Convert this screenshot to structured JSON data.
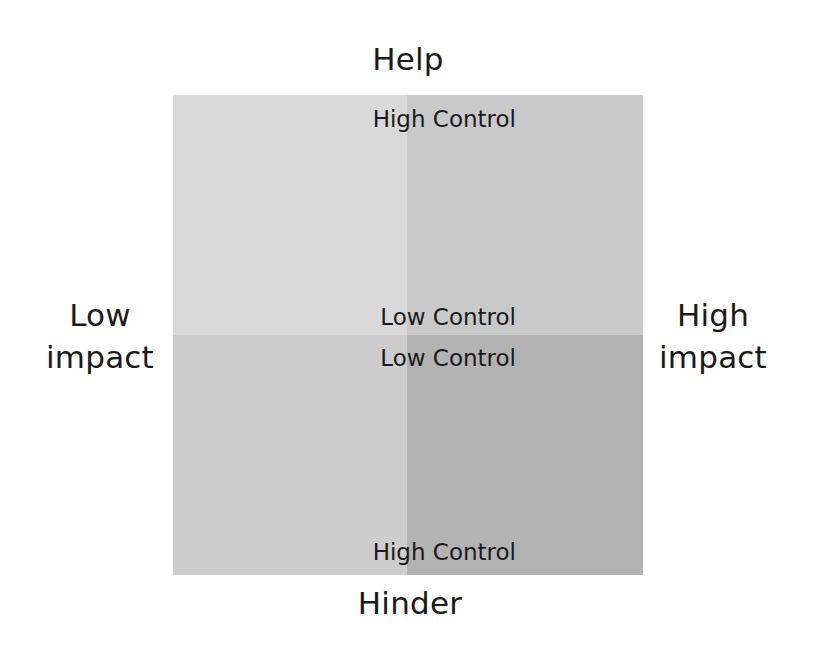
{
  "diagram": {
    "type": "2x2 quadrant matrix",
    "axes": {
      "top": "Help",
      "bottom": "Hinder",
      "left": {
        "line1": "Low",
        "line2": "impact"
      },
      "right": {
        "line1": "High",
        "line2": "impact"
      }
    },
    "control_labels": {
      "top": "High Control",
      "center_upper": "Low Control",
      "center_lower": "Low Control",
      "bottom": "High Control"
    },
    "quadrants": {
      "top_left": {
        "position": "Help / Low impact",
        "color": "#d9d9d9"
      },
      "top_right": {
        "position": "Help / High impact",
        "color": "#c9c9c9"
      },
      "bottom_left": {
        "position": "Hinder / Low impact",
        "color": "#cdcdcd"
      },
      "bottom_right": {
        "position": "Hinder / High impact",
        "color": "#b3b3b3"
      }
    }
  }
}
